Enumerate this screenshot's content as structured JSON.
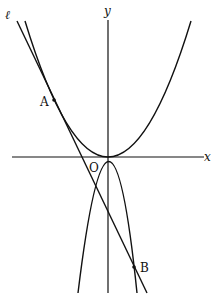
{
  "diagram": {
    "type": "coordinate-plane",
    "axes": {
      "x_label": "x",
      "y_label": "y",
      "origin_label": "O"
    },
    "curves": [
      {
        "name": "upper-parabola",
        "description": "upward-opening parabola with vertex at O"
      },
      {
        "name": "lower-parabola",
        "description": "downward-opening parabola through O"
      }
    ],
    "line": {
      "label": "ℓ",
      "description": "line tangent to upper parabola at A, meeting lower parabola at B"
    },
    "points": [
      {
        "label": "A"
      },
      {
        "label": "B"
      }
    ]
  }
}
